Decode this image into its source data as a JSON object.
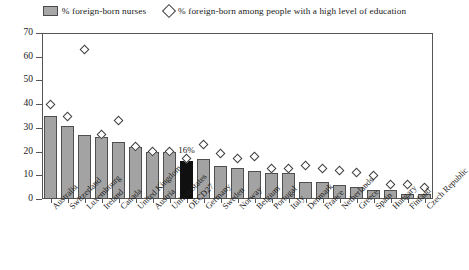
{
  "legend": {
    "items": [
      {
        "marker": "bar-swatch",
        "label": "% foreign-born nurses"
      },
      {
        "marker": "diamond-swatch",
        "label": "% foreign-born among people with a high level of education"
      }
    ]
  },
  "annotation": {
    "oecd_value_label": "16%"
  },
  "colors": {
    "bar_fill": "#a3a3a3",
    "bar_stroke": "#4f4f4f",
    "highlight_fill": "#101010",
    "diamond_stroke": "#3d3d3d",
    "axis": "#555555"
  },
  "chart_data": {
    "type": "bar",
    "title": "",
    "subtitle": "",
    "xlabel": "",
    "ylabel": "",
    "ylim": [
      0,
      70
    ],
    "yticks": [
      0,
      10,
      20,
      30,
      40,
      50,
      60,
      70
    ],
    "grid": false,
    "legend_position": "top",
    "highlight_category": "OECD27",
    "categories": [
      "Australia",
      "Switzerland",
      "Luxembourg",
      "Ireland",
      "Canada",
      "United Kingdom",
      "Austria",
      "United States",
      "OECD27",
      "Germany",
      "Sweden",
      "Norway",
      "Belgium",
      "Portugal",
      "Italy",
      "Denmark",
      "France",
      "Netherlands",
      "Greece",
      "Spain",
      "Hungary",
      "Finland",
      "Czech Republic"
    ],
    "series": [
      {
        "name": "% foreign-born nurses",
        "type": "bar",
        "values": [
          35,
          31,
          27,
          26,
          24,
          22,
          20,
          20,
          16,
          17,
          14,
          13,
          12,
          11,
          11,
          7,
          7,
          6,
          5,
          4,
          4,
          2,
          2
        ]
      },
      {
        "name": "% foreign-born among people with a high level of education",
        "type": "scatter",
        "marker": "diamond",
        "values": [
          40,
          35,
          63,
          27,
          33,
          22,
          20,
          20,
          17,
          23,
          19,
          17,
          18,
          13,
          13,
          14,
          13,
          12,
          11,
          10,
          6,
          6,
          5
        ]
      }
    ]
  }
}
